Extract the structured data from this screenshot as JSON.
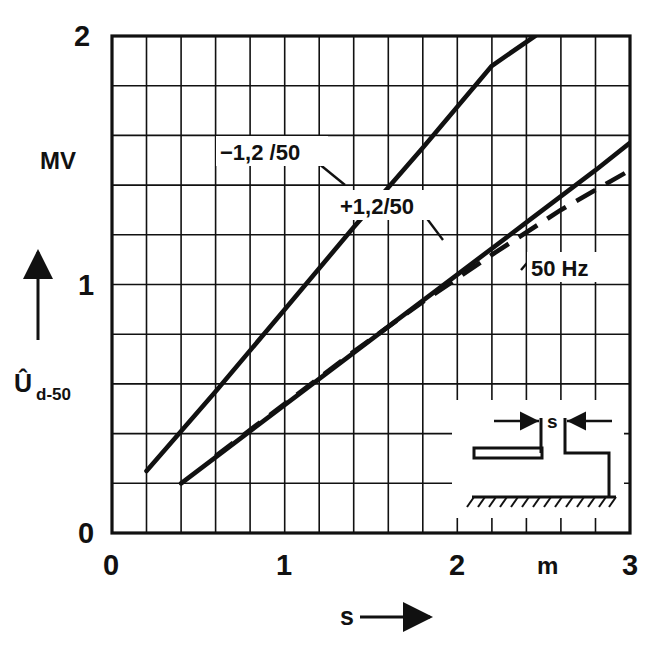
{
  "figure": {
    "name": "breakdown-voltage-vs-gap-spacing",
    "background": "#ffffff",
    "ink_color": "#111111"
  },
  "axes": {
    "y": {
      "name": "U-hat d-50",
      "symbol_main": "Û",
      "symbol_sub": "d-50",
      "unit": "MV",
      "min": 0,
      "max": 2,
      "major_ticks": [
        "0",
        "1",
        "2"
      ],
      "major_tick_values": [
        0,
        1,
        2
      ],
      "minor_step": 0.2,
      "tick_count": 10,
      "arrow": "up"
    },
    "x": {
      "name": "s",
      "unit": "m",
      "min": 0,
      "max": 3,
      "major_ticks": [
        "0",
        "1",
        "2",
        "3"
      ],
      "major_tick_values": [
        0,
        1,
        2,
        3
      ],
      "minor_step": 0.2,
      "tick_count": 15,
      "arrow": "right",
      "axis_label": "s"
    }
  },
  "grid": {
    "visible": true,
    "x_divisions": 15,
    "y_divisions": 10,
    "color": "#111111"
  },
  "chart_data": {
    "type": "line",
    "title": "",
    "xlabel": "s",
    "ylabel": "Û d-50",
    "xunit": "m",
    "yunit": "MV",
    "xlim": [
      0,
      3
    ],
    "ylim": [
      0,
      2
    ],
    "grid": true,
    "legend": "inline-annotations",
    "series": [
      {
        "name": "-1,2/50",
        "label": "−1,2 /50",
        "style": "solid",
        "description": "negative lightning impulse 1,2/50 µs",
        "x": [
          0.2,
          0.6,
          1.0,
          1.4,
          1.8,
          2.2,
          2.45
        ],
        "y": [
          0.25,
          0.57,
          0.9,
          1.23,
          1.55,
          1.88,
          2.0
        ]
      },
      {
        "name": "+1,2/50",
        "label": "+1,2/50",
        "style": "solid",
        "description": "positive lightning impulse 1,2/50 µs",
        "x": [
          0.4,
          0.8,
          1.2,
          1.6,
          2.0,
          2.4,
          2.8,
          3.0
        ],
        "y": [
          0.2,
          0.41,
          0.62,
          0.83,
          1.04,
          1.25,
          1.46,
          1.57
        ]
      },
      {
        "name": "50 Hz",
        "label": "50 Hz",
        "style": "dashed",
        "description": "power frequency AC 50 Hz",
        "x": [
          0.6,
          1.0,
          1.4,
          1.8,
          2.2,
          2.6,
          3.0
        ],
        "y": [
          0.31,
          0.52,
          0.73,
          0.93,
          1.12,
          1.3,
          1.46
        ]
      }
    ],
    "annotations": [
      {
        "text": "−1,2 /50",
        "x": 1.28,
        "y": 1.62,
        "points_to": {
          "x": 1.66,
          "y": 1.45
        }
      },
      {
        "text": "+1,2/50",
        "x": 1.8,
        "y": 1.33,
        "points_to": {
          "x": 1.82,
          "y": 1.11
        }
      },
      {
        "text": "50 Hz",
        "x": 2.33,
        "y": 1.15,
        "points_to": {
          "x": 2.34,
          "y": 1.22
        }
      }
    ]
  },
  "inset": {
    "name": "electrode-gap-geometry",
    "gap_label": "s",
    "description": "rod-rod electrode gap above hatched ground plane",
    "left_electrode": "horizontal-rod",
    "right_electrode": "vertical-rod-to-ground",
    "ground": "hatched-line"
  }
}
